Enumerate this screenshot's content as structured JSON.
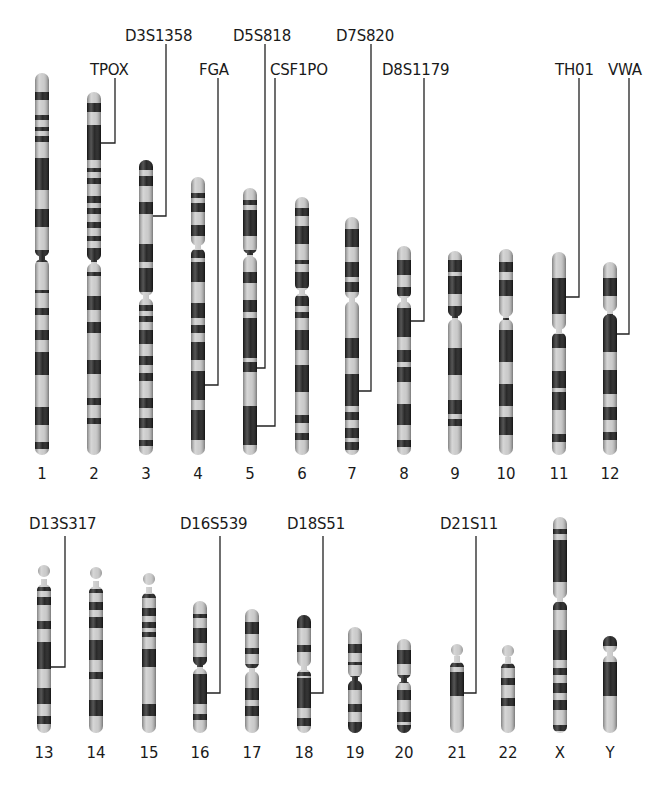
{
  "figure": {
    "colors": {
      "dark_band": "#1c1c1c",
      "light_band": "#c9c9c9",
      "line": "#222222",
      "background": "#ffffff"
    }
  },
  "chromosomes": [
    {
      "id": "1",
      "x": 42,
      "top": 73,
      "bottom": 455,
      "cen": 258,
      "bands": [
        [
          92,
          100
        ],
        [
          115,
          120
        ],
        [
          127,
          131
        ],
        [
          136,
          142
        ],
        [
          158,
          190
        ],
        [
          209,
          227
        ],
        [
          250,
          262
        ],
        [
          290,
          293
        ],
        [
          308,
          315
        ],
        [
          330,
          340
        ],
        [
          352,
          375
        ],
        [
          407,
          425
        ],
        [
          442,
          449
        ]
      ]
    },
    {
      "id": "2",
      "x": 94,
      "top": 92,
      "bottom": 455,
      "cen": 262,
      "bands": [
        [
          103,
          112
        ],
        [
          125,
          160
        ],
        [
          168,
          172
        ],
        [
          178,
          184
        ],
        [
          196,
          203
        ],
        [
          208,
          214
        ],
        [
          222,
          228
        ],
        [
          236,
          241
        ],
        [
          248,
          262
        ],
        [
          272,
          276
        ],
        [
          296,
          310
        ],
        [
          322,
          333
        ],
        [
          360,
          374
        ],
        [
          398,
          405
        ],
        [
          418,
          424
        ]
      ]
    },
    {
      "id": "3",
      "x": 146,
      "top": 160,
      "bottom": 455,
      "cen": 297,
      "bands": [
        [
          160,
          170
        ],
        [
          176,
          186
        ],
        [
          202,
          214
        ],
        [
          244,
          262
        ],
        [
          268,
          292
        ],
        [
          305,
          311
        ],
        [
          316,
          322
        ],
        [
          330,
          344
        ],
        [
          356,
          365
        ],
        [
          373,
          381
        ],
        [
          398,
          408
        ],
        [
          418,
          428
        ],
        [
          440,
          446
        ]
      ]
    },
    {
      "id": "4",
      "x": 198,
      "top": 177,
      "bottom": 455,
      "cen": 247,
      "bands": [
        [
          193,
          198
        ],
        [
          203,
          212
        ],
        [
          225,
          236
        ],
        [
          250,
          258
        ],
        [
          262,
          282
        ],
        [
          303,
          318
        ],
        [
          325,
          333
        ],
        [
          342,
          360
        ],
        [
          371,
          400
        ],
        [
          410,
          440
        ]
      ]
    },
    {
      "id": "5",
      "x": 250,
      "top": 188,
      "bottom": 455,
      "cen": 255,
      "bands": [
        [
          200,
          205
        ],
        [
          210,
          236
        ],
        [
          250,
          255
        ],
        [
          272,
          283
        ],
        [
          300,
          312
        ],
        [
          318,
          358
        ],
        [
          362,
          372
        ],
        [
          406,
          445
        ]
      ]
    },
    {
      "id": "6",
      "x": 302,
      "top": 197,
      "bottom": 455,
      "cen": 292,
      "bands": [
        [
          208,
          216
        ],
        [
          226,
          244
        ],
        [
          260,
          264
        ],
        [
          272,
          288
        ],
        [
          296,
          306
        ],
        [
          312,
          318
        ],
        [
          330,
          350
        ],
        [
          365,
          392
        ],
        [
          415,
          423
        ],
        [
          433,
          440
        ]
      ]
    },
    {
      "id": "7",
      "x": 352,
      "top": 217,
      "bottom": 455,
      "cen": 300,
      "bands": [
        [
          229,
          247
        ],
        [
          262,
          277
        ],
        [
          282,
          292
        ],
        [
          338,
          358
        ],
        [
          374,
          406
        ],
        [
          412,
          420
        ],
        [
          428,
          438
        ],
        [
          442,
          450
        ]
      ]
    },
    {
      "id": "8",
      "x": 404,
      "top": 246,
      "bottom": 455,
      "cen": 300,
      "bands": [
        [
          260,
          275
        ],
        [
          287,
          296
        ],
        [
          308,
          337
        ],
        [
          350,
          362
        ],
        [
          367,
          382
        ],
        [
          404,
          425
        ],
        [
          440,
          447
        ]
      ]
    },
    {
      "id": "9",
      "x": 455,
      "top": 251,
      "bottom": 455,
      "cen": 318,
      "bands": [
        [
          260,
          272
        ],
        [
          276,
          294
        ],
        [
          306,
          318
        ],
        [
          348,
          375
        ],
        [
          400,
          414
        ],
        [
          419,
          426
        ]
      ]
    },
    {
      "id": "10",
      "x": 506,
      "top": 249,
      "bottom": 455,
      "cen": 318,
      "bands": [
        [
          262,
          272
        ],
        [
          280,
          296
        ],
        [
          318,
          320
        ],
        [
          330,
          362
        ],
        [
          384,
          406
        ],
        [
          417,
          435
        ]
      ]
    },
    {
      "id": "11",
      "x": 559,
      "top": 252,
      "bottom": 455,
      "cen": 331,
      "bands": [
        [
          278,
          314
        ],
        [
          334,
          348
        ],
        [
          371,
          388
        ],
        [
          392,
          410
        ],
        [
          434,
          442
        ]
      ]
    },
    {
      "id": "12",
      "x": 610,
      "top": 262,
      "bottom": 455,
      "cen": 313,
      "bands": [
        [
          278,
          296
        ],
        [
          314,
          352
        ],
        [
          370,
          394
        ],
        [
          407,
          420
        ],
        [
          432,
          440
        ]
      ]
    },
    {
      "id": "13",
      "x": 44,
      "top": 565,
      "bottom": 733,
      "cen": 583,
      "sat": true,
      "bands": [
        [
          587,
          591
        ],
        [
          597,
          605
        ],
        [
          621,
          629
        ],
        [
          642,
          669
        ],
        [
          688,
          704
        ],
        [
          716,
          724
        ]
      ]
    },
    {
      "id": "14",
      "x": 96,
      "top": 567,
      "bottom": 733,
      "cen": 585,
      "sat": true,
      "bands": [
        [
          589,
          593
        ],
        [
          602,
          610
        ],
        [
          617,
          628
        ],
        [
          640,
          660
        ],
        [
          672,
          679
        ],
        [
          700,
          716
        ]
      ]
    },
    {
      "id": "15",
      "x": 149,
      "top": 573,
      "bottom": 733,
      "cen": 591,
      "sat": true,
      "bands": [
        [
          594,
          598
        ],
        [
          608,
          616
        ],
        [
          622,
          628
        ],
        [
          632,
          637
        ],
        [
          649,
          667
        ],
        [
          704,
          716
        ]
      ]
    },
    {
      "id": "16",
      "x": 200,
      "top": 601,
      "bottom": 733,
      "cen": 667,
      "bands": [
        [
          614,
          618
        ],
        [
          628,
          643
        ],
        [
          657,
          667
        ],
        [
          674,
          704
        ],
        [
          714,
          720
        ]
      ]
    },
    {
      "id": "17",
      "x": 252,
      "top": 609,
      "bottom": 733,
      "cen": 670,
      "bands": [
        [
          622,
          634
        ],
        [
          648,
          654
        ],
        [
          664,
          668
        ],
        [
          688,
          700
        ],
        [
          706,
          716
        ]
      ]
    },
    {
      "id": "18",
      "x": 304,
      "top": 615,
      "bottom": 733,
      "cen": 668,
      "bands": [
        [
          615,
          628
        ],
        [
          645,
          652
        ],
        [
          672,
          676
        ],
        [
          678,
          708
        ],
        [
          718,
          726
        ]
      ]
    },
    {
      "id": "19",
      "x": 355,
      "top": 627,
      "bottom": 733,
      "cen": 679,
      "bands": [
        [
          644,
          653
        ],
        [
          662,
          665
        ],
        [
          676,
          690
        ],
        [
          704,
          712
        ],
        [
          722,
          733
        ]
      ]
    },
    {
      "id": "20",
      "x": 404,
      "top": 639,
      "bottom": 733,
      "cen": 680,
      "bands": [
        [
          650,
          664
        ],
        [
          675,
          683
        ],
        [
          690,
          700
        ],
        [
          712,
          722
        ],
        [
          725,
          733
        ]
      ]
    },
    {
      "id": "21",
      "x": 457,
      "top": 644,
      "bottom": 733,
      "cen": 660,
      "sat": true,
      "bands": [
        [
          663,
          667
        ],
        [
          672,
          696
        ]
      ]
    },
    {
      "id": "22",
      "x": 508,
      "top": 645,
      "bottom": 733,
      "cen": 661,
      "sat": true,
      "bands": [
        [
          664,
          668
        ],
        [
          678,
          685
        ],
        [
          698,
          706
        ]
      ]
    },
    {
      "id": "X",
      "x": 560,
      "top": 517,
      "bottom": 733,
      "cen": 600,
      "bands": [
        [
          529,
          534
        ],
        [
          540,
          582
        ],
        [
          602,
          610
        ],
        [
          630,
          660
        ],
        [
          668,
          675
        ],
        [
          683,
          693
        ],
        [
          700,
          710
        ],
        [
          725,
          731
        ]
      ]
    },
    {
      "id": "Y",
      "x": 610,
      "top": 636,
      "bottom": 733,
      "cen": 654,
      "bands": [
        [
          636,
          646
        ],
        [
          662,
          696
        ]
      ]
    }
  ],
  "markers": [
    {
      "name": "TPOX",
      "chrom": "2",
      "label_x": 90,
      "label_y": 77,
      "line_x": 115,
      "line_top": 78,
      "attach_y": 143
    },
    {
      "name": "D3S1358",
      "chrom": "3",
      "label_x": 125,
      "label_y": 43,
      "line_x": 166,
      "line_top": 44,
      "attach_y": 216
    },
    {
      "name": "FGA",
      "chrom": "4",
      "label_x": 199,
      "label_y": 77,
      "line_x": 218,
      "line_top": 78,
      "attach_y": 385
    },
    {
      "name": "D5S818",
      "chrom": "5",
      "label_x": 233,
      "label_y": 43,
      "line_x": 265,
      "line_top": 44,
      "attach_y": 368
    },
    {
      "name": "CSF1PO",
      "chrom": "5",
      "label_x": 270,
      "label_y": 77,
      "line_x": 275,
      "line_top": 78,
      "attach_y": 426
    },
    {
      "name": "D7S820",
      "chrom": "7",
      "label_x": 336,
      "label_y": 43,
      "line_x": 371,
      "line_top": 44,
      "attach_y": 391
    },
    {
      "name": "D8S1179",
      "chrom": "8",
      "label_x": 382,
      "label_y": 77,
      "line_x": 424,
      "line_top": 78,
      "attach_y": 321
    },
    {
      "name": "TH01",
      "chrom": "11",
      "label_x": 555,
      "label_y": 77,
      "line_x": 579,
      "line_top": 78,
      "attach_y": 297
    },
    {
      "name": "VWA",
      "chrom": "12",
      "label_x": 608,
      "label_y": 77,
      "line_x": 629,
      "line_top": 78,
      "attach_y": 334
    },
    {
      "name": "D13S317",
      "chrom": "13",
      "label_x": 29,
      "label_y": 531,
      "line_x": 65,
      "line_top": 536,
      "attach_y": 667
    },
    {
      "name": "D16S539",
      "chrom": "16",
      "label_x": 180,
      "label_y": 531,
      "line_x": 220,
      "line_top": 536,
      "attach_y": 693
    },
    {
      "name": "D18S51",
      "chrom": "18",
      "label_x": 287,
      "label_y": 531,
      "line_x": 323,
      "line_top": 536,
      "attach_y": 693
    },
    {
      "name": "D21S11",
      "chrom": "21",
      "label_x": 440,
      "label_y": 531,
      "line_x": 476,
      "line_top": 536,
      "attach_y": 693
    }
  ],
  "number_labels": {
    "top_row_y": 479,
    "bottom_row_y": 758
  }
}
